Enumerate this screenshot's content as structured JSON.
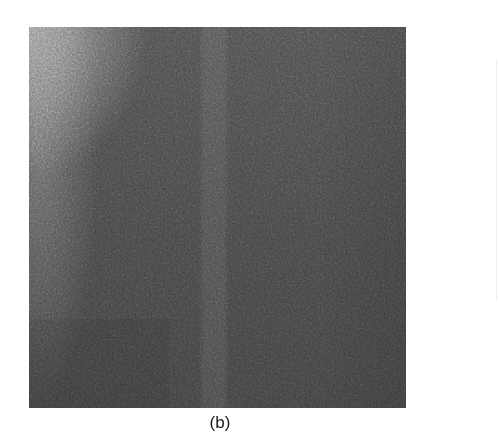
{
  "figure": {
    "panel_label": "(b)",
    "image_description": "grayscale noise texture",
    "colors": {
      "background": "#ffffff",
      "texture_dark": "#404040",
      "texture_light": "#8a8a8a",
      "caption_text": "#1a1a1a"
    }
  }
}
